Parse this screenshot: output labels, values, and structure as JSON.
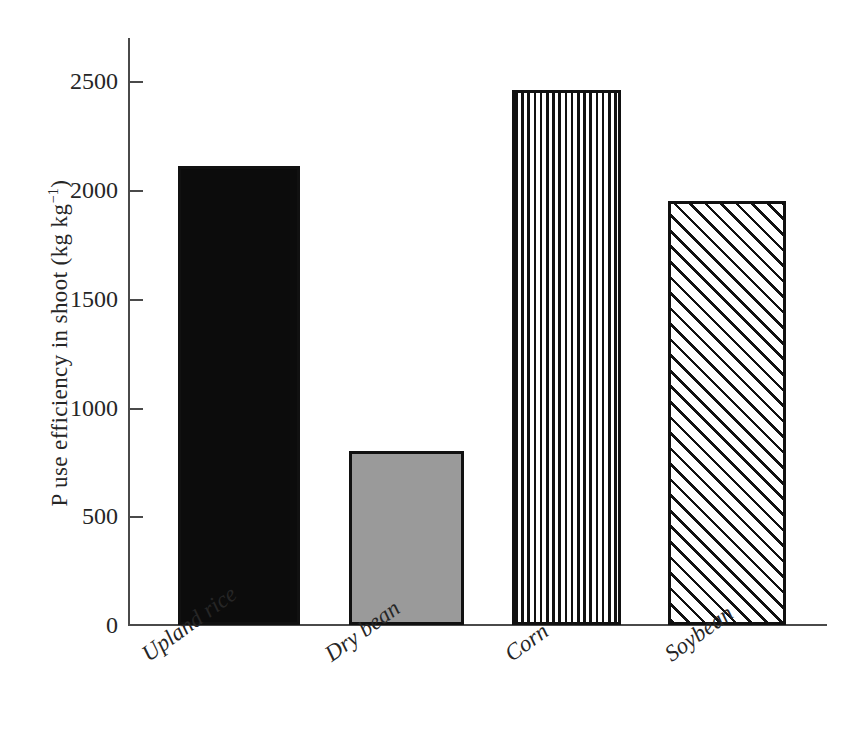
{
  "chart_data": {
    "type": "bar",
    "title": "",
    "xlabel": "",
    "ylabel": "P use efficiency in shoot (kg kg⁻¹)",
    "ylabel_main": "P use efficiency in shoot (kg kg",
    "ylabel_sup": "−1",
    "ylabel_tail": ")",
    "categories": [
      "Upland rice",
      "Dry bean",
      "Corn",
      "Soybean"
    ],
    "values": [
      2110,
      800,
      2460,
      1950
    ],
    "ylim": [
      0,
      2700
    ],
    "yticks": [
      0,
      500,
      1000,
      1500,
      2000,
      2500
    ],
    "ytick_labels": [
      "0",
      "500",
      "1000",
      "1500",
      "2000",
      "2500"
    ],
    "grid": false,
    "legend": false,
    "legend_position": "none",
    "bar_fills": [
      "solid-black",
      "solid-gray",
      "vertical-stripes",
      "diagonal-hatch"
    ],
    "colors": {
      "upland_rice": "#0c0c0c",
      "dry_bean": "#9a9a9a",
      "corn": "#ffffff",
      "soybean": "#ffffff",
      "bar_outline": "#111111",
      "axis": "#4a4a4a",
      "text": "#262626",
      "background": "#ffffff"
    },
    "bars": [
      {
        "category": "Upland rice",
        "value": 2110,
        "fill": "solid-black",
        "left_px": 50,
        "width_px": 122
      },
      {
        "category": "Dry bean",
        "value": 800,
        "fill": "solid-gray",
        "left_px": 221,
        "width_px": 115
      },
      {
        "category": "Corn",
        "value": 2460,
        "fill": "vertical-stripes",
        "left_px": 384,
        "width_px": 109
      },
      {
        "category": "Soybean",
        "value": 1950,
        "fill": "diagonal-hatch",
        "left_px": 540,
        "width_px": 118
      }
    ]
  }
}
